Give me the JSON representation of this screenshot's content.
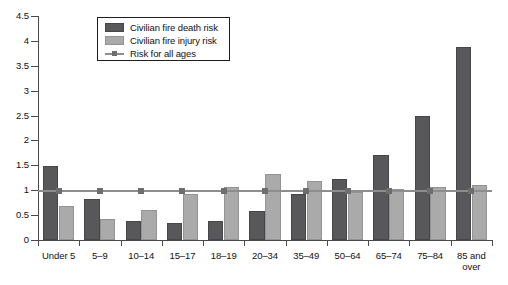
{
  "chart_data": {
    "type": "bar",
    "title": "",
    "subtitle": "",
    "xlabel": "",
    "ylabel": "",
    "ylim": [
      0,
      4.5
    ],
    "yticks": [
      "0",
      "0.5",
      "1",
      "1.5",
      "2",
      "2.5",
      "3",
      "3.5",
      "4",
      "4.5"
    ],
    "ytick_values": [
      0,
      0.5,
      1,
      1.5,
      2,
      2.5,
      3,
      3.5,
      4,
      4.5
    ],
    "grid": false,
    "legend_position": "top-center",
    "categories": [
      "Under 5",
      "5–9",
      "10–14",
      "15–17",
      "18–19",
      "20–34",
      "35–49",
      "50–64",
      "65–74",
      "75–84",
      "85 and over"
    ],
    "series": [
      {
        "name": "Civilian fire death risk",
        "kind": "bar",
        "color": "#58585a",
        "values": [
          1.48,
          0.82,
          0.39,
          0.35,
          0.39,
          0.58,
          0.93,
          1.23,
          1.7,
          2.5,
          3.87
        ]
      },
      {
        "name": "Civilian fire injury risk",
        "kind": "bar",
        "color": "#aaaaaa",
        "values": [
          0.69,
          0.43,
          0.61,
          0.93,
          1.07,
          1.33,
          1.18,
          0.97,
          1.02,
          1.07,
          1.1
        ]
      },
      {
        "name": "Risk for all ages",
        "kind": "line",
        "color": "#8d8d8d",
        "values": [
          1.0,
          1.0,
          1.0,
          1.0,
          1.0,
          1.0,
          1.0,
          1.0,
          1.0,
          1.0,
          1.0
        ]
      }
    ]
  },
  "legend": {
    "entries": [
      {
        "label": "Civilian fire death risk",
        "swatch": "death"
      },
      {
        "label": "Civilian fire injury risk",
        "swatch": "injury"
      },
      {
        "label": "Risk for all ages",
        "swatch": "line"
      }
    ]
  },
  "colors": {
    "death_bar": "#58585a",
    "injury_bar": "#aaaaaa",
    "reference_line": "#8d8d8d",
    "axis": "#4a4a4a",
    "background": "#ffffff"
  }
}
